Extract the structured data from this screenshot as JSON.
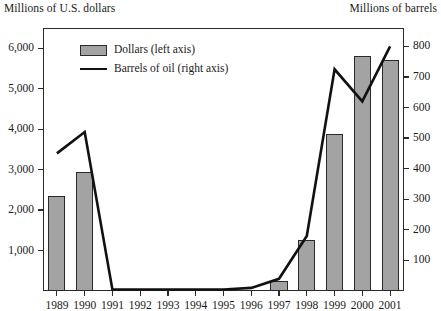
{
  "chart_data": {
    "type": "bar",
    "title": "",
    "subtitle": "",
    "xlabel": "",
    "ylabel": "Millions of U.S. dollars",
    "y2label": "Millions of barrels",
    "grid": false,
    "legend_position": "top-left-inside",
    "categories": [
      "1989",
      "1990",
      "1991",
      "1992",
      "1993",
      "1994",
      "1995",
      "1996",
      "1997",
      "1998",
      "1999",
      "2000",
      "2001"
    ],
    "ylim": [
      0,
      6500
    ],
    "yticks": [
      "1,000",
      "2,000",
      "3,000",
      "4,000",
      "5,000",
      "6,000"
    ],
    "ytick_values": [
      1000,
      2000,
      3000,
      4000,
      5000,
      6000
    ],
    "y2lim": [
      0,
      860
    ],
    "y2ticks": [
      "100",
      "200",
      "300",
      "400",
      "500",
      "600",
      "700",
      "800"
    ],
    "y2tick_values": [
      100,
      200,
      300,
      400,
      500,
      600,
      700,
      800
    ],
    "series": [
      {
        "name": "Dollars (left axis)",
        "type": "bar",
        "axis": "left",
        "color": "#a3a3a3",
        "values": [
          2350,
          2950,
          0,
          0,
          0,
          0,
          0,
          0,
          250,
          1250,
          3870,
          5800,
          5700
        ]
      },
      {
        "name": "Barrels of oil (right axis)",
        "type": "line",
        "axis": "right",
        "color": "#111111",
        "values": [
          450,
          520,
          5,
          5,
          5,
          5,
          5,
          10,
          40,
          180,
          725,
          620,
          800
        ]
      }
    ],
    "legend": [
      {
        "label": "Dollars (left axis)",
        "marker": "swatch",
        "color": "#a3a3a3"
      },
      {
        "label": "Barrels of oil (right axis)",
        "marker": "line",
        "color": "#111111"
      }
    ]
  },
  "labels": {
    "left_axis_title": "Millions of U.S. dollars",
    "right_axis_title": "Millions of barrels"
  }
}
